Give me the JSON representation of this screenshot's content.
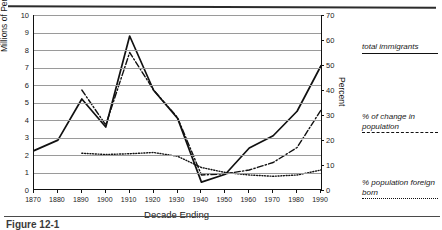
{
  "caption": "Figure 12-1",
  "chart_data": {
    "type": "line",
    "title": "",
    "xlabel": "Decade Ending",
    "ylabel": "Millions of Persons",
    "y2label": "Percent",
    "categories": [
      "1870",
      "1880",
      "1890",
      "1900",
      "1910",
      "1920",
      "1930",
      "1940",
      "1950",
      "1960",
      "1970",
      "1980",
      "1990"
    ],
    "xlim": [
      1870,
      1990
    ],
    "ylim": [
      0,
      10
    ],
    "y2lim": [
      0,
      70
    ],
    "yticks": [
      "0",
      "1",
      "2",
      "3",
      "4",
      "5",
      "6",
      "7",
      "8",
      "9",
      "10"
    ],
    "y2ticks": [
      "0",
      "10",
      "20",
      "30",
      "40",
      "50",
      "60",
      "70"
    ],
    "grid": true,
    "legend_position": "right",
    "series": [
      {
        "name": "total immigrants",
        "style": "solid",
        "axis": "left",
        "units": "millions",
        "x": [
          "1870",
          "1880",
          "1890",
          "1900",
          "1910",
          "1920",
          "1930",
          "1940",
          "1950",
          "1960",
          "1970",
          "1980",
          "1990"
        ],
        "values": [
          2.25,
          2.85,
          5.2,
          3.6,
          8.8,
          5.7,
          4.1,
          0.45,
          0.9,
          2.4,
          3.1,
          4.5,
          7.1
        ]
      },
      {
        "name": "% of change in population",
        "style": "dash-dot",
        "axis": "right",
        "units": "percent",
        "x": [
          "1890",
          "1900",
          "1910",
          "1920",
          "1930",
          "1940",
          "1950",
          "1960",
          "1970",
          "1980",
          "1990"
        ],
        "values": [
          40,
          26,
          55,
          40,
          29,
          6,
          6.5,
          8,
          11,
          17,
          32
        ]
      },
      {
        "name": "% population foreign born",
        "style": "dotted",
        "axis": "right",
        "units": "percent",
        "x": [
          "1890",
          "1900",
          "1910",
          "1920",
          "1930",
          "1940",
          "1950",
          "1960",
          "1970",
          "1980",
          "1990"
        ],
        "values": [
          14.7,
          14.2,
          14.5,
          15.0,
          13.5,
          9.0,
          7.0,
          6.0,
          5.5,
          6.0,
          8.0
        ]
      }
    ]
  }
}
